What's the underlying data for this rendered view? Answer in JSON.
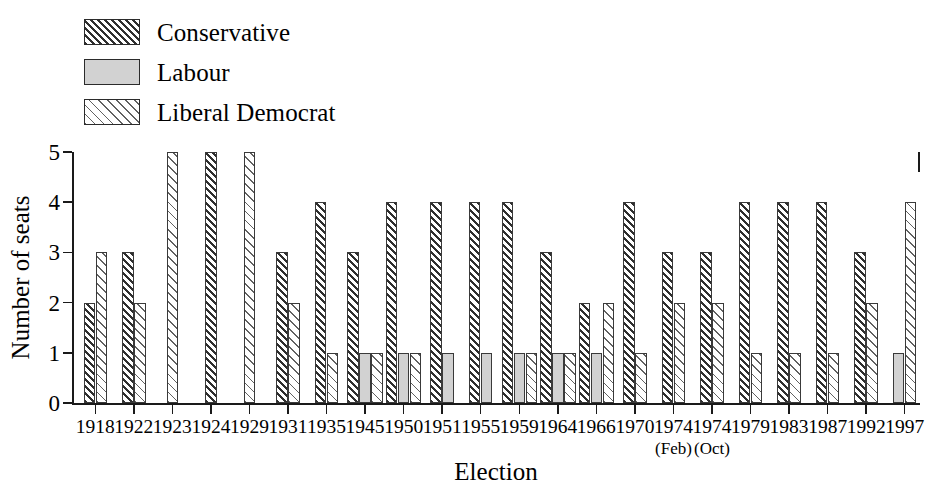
{
  "legend": {
    "items": [
      {
        "label": "Conservative",
        "key": "con",
        "swatch": "dense-dark-diagonal-hatch",
        "color": "#2f2f2f"
      },
      {
        "label": "Labour",
        "key": "lab",
        "swatch": "solid-light-gray",
        "color": "#d2d2d2"
      },
      {
        "label": "Liberal Democrat",
        "key": "lib",
        "swatch": "sparse-light-diagonal-hatch",
        "color": "#616161"
      }
    ]
  },
  "chart_data": {
    "type": "bar",
    "title": "",
    "xlabel": "Election",
    "ylabel": "Number of seats",
    "ylim": [
      0,
      5
    ],
    "yticks": [
      0,
      1,
      2,
      3,
      4,
      5
    ],
    "grid": false,
    "legend_position": "top-left",
    "categories": [
      "1918",
      "1922",
      "1923",
      "1924",
      "1929",
      "1931",
      "1935",
      "1945",
      "1950",
      "1951",
      "1955",
      "1959",
      "1964",
      "1966",
      "1970",
      "1974",
      "1974",
      "1979",
      "1983",
      "1987",
      "1992",
      "1997"
    ],
    "category_sublabels": [
      "",
      "",
      "",
      "",
      "",
      "",
      "",
      "",
      "",
      "",
      "",
      "",
      "",
      "",
      "",
      "(Feb)",
      "(Oct)",
      "",
      "",
      "",
      "",
      ""
    ],
    "series": [
      {
        "name": "Conservative",
        "values": [
          2,
          3,
          0,
          5,
          0,
          3,
          4,
          3,
          4,
          4,
          4,
          4,
          3,
          2,
          4,
          3,
          3,
          4,
          4,
          4,
          3,
          0
        ]
      },
      {
        "name": "Labour",
        "values": [
          0,
          0,
          0,
          0,
          0,
          0,
          0,
          1,
          1,
          1,
          1,
          1,
          1,
          1,
          0,
          0,
          0,
          0,
          0,
          0,
          0,
          1
        ]
      },
      {
        "name": "Liberal Democrat",
        "values": [
          3,
          2,
          5,
          0,
          5,
          2,
          1,
          1,
          1,
          0,
          0,
          1,
          1,
          2,
          1,
          2,
          2,
          1,
          1,
          1,
          2,
          4
        ]
      }
    ]
  }
}
